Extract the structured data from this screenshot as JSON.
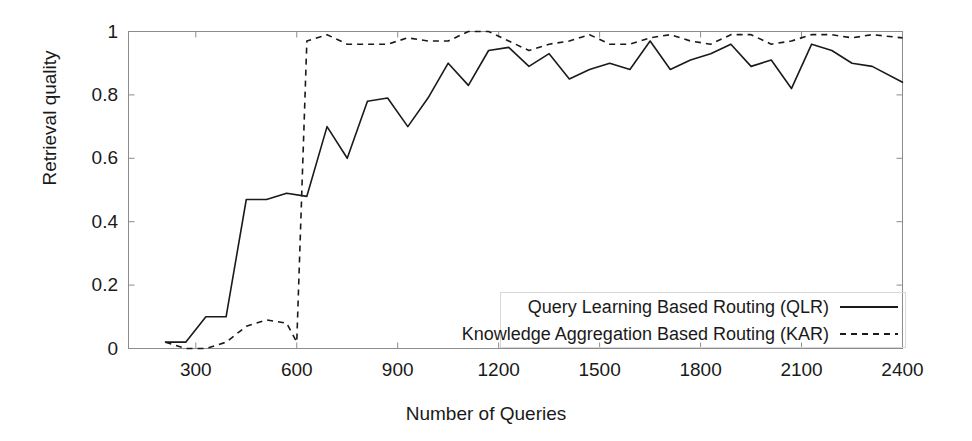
{
  "chart_data": {
    "type": "line",
    "title": "",
    "xlabel": "Number of Queries",
    "ylabel": "Retrieval quality",
    "xlim": [
      100,
      2400
    ],
    "ylim": [
      0,
      1
    ],
    "xticks": [
      300,
      600,
      900,
      1200,
      1500,
      1800,
      2100,
      2400
    ],
    "xtick_labels": [
      "300",
      "600",
      "900",
      "1200",
      "1500",
      "1800",
      "2100",
      "2400"
    ],
    "yticks": [
      0,
      0.2,
      0.4,
      0.6,
      0.8,
      1
    ],
    "ytick_labels": [
      "0",
      "0.2",
      "0.4",
      "0.6",
      "0.8",
      "1"
    ],
    "grid": false,
    "legend_position": "lower right",
    "series": [
      {
        "name": "Query Learning Based Routing (QLR)",
        "style": "solid",
        "color": "#1a1a1a",
        "x": [
          210,
          270,
          330,
          390,
          450,
          510,
          570,
          630,
          690,
          750,
          810,
          870,
          930,
          990,
          1050,
          1110,
          1170,
          1230,
          1290,
          1350,
          1410,
          1470,
          1530,
          1590,
          1650,
          1710,
          1770,
          1830,
          1890,
          1950,
          2010,
          2070,
          2130,
          2190,
          2250,
          2310,
          2400
        ],
        "y": [
          0.02,
          0.02,
          0.1,
          0.1,
          0.47,
          0.47,
          0.49,
          0.48,
          0.7,
          0.6,
          0.78,
          0.79,
          0.7,
          0.79,
          0.9,
          0.83,
          0.94,
          0.95,
          0.89,
          0.93,
          0.85,
          0.88,
          0.9,
          0.88,
          0.97,
          0.88,
          0.91,
          0.93,
          0.96,
          0.89,
          0.91,
          0.82,
          0.96,
          0.94,
          0.9,
          0.89,
          0.84
        ]
      },
      {
        "name": "Knowledge Aggregation Based Routing (KAR)",
        "style": "dashed",
        "color": "#1a1a1a",
        "x": [
          210,
          270,
          330,
          390,
          450,
          510,
          570,
          600,
          630,
          690,
          750,
          810,
          870,
          930,
          990,
          1050,
          1110,
          1170,
          1230,
          1290,
          1350,
          1410,
          1470,
          1530,
          1590,
          1650,
          1710,
          1770,
          1830,
          1890,
          1950,
          2010,
          2070,
          2130,
          2190,
          2250,
          2310,
          2400
        ],
        "y": [
          0.02,
          0.0,
          0.0,
          0.02,
          0.07,
          0.09,
          0.08,
          0.02,
          0.97,
          0.99,
          0.96,
          0.96,
          0.96,
          0.98,
          0.97,
          0.97,
          1.0,
          1.0,
          0.97,
          0.94,
          0.96,
          0.97,
          0.99,
          0.96,
          0.96,
          0.98,
          0.99,
          0.97,
          0.96,
          0.99,
          0.99,
          0.96,
          0.97,
          0.99,
          0.99,
          0.98,
          0.99,
          0.98
        ]
      }
    ]
  },
  "legend": {
    "items": [
      {
        "label": "Query Learning Based Routing (QLR)",
        "style": "solid"
      },
      {
        "label": "Knowledge Aggregation Based Routing (KAR)",
        "style": "dashed"
      }
    ]
  },
  "axes": {
    "x_title": "Number of Queries",
    "y_title": "Retrieval quality"
  },
  "colors": {
    "line": "#1a1a1a",
    "axis": "#8c8c8c",
    "text": "#1a1a1a",
    "background": "#ffffff"
  }
}
